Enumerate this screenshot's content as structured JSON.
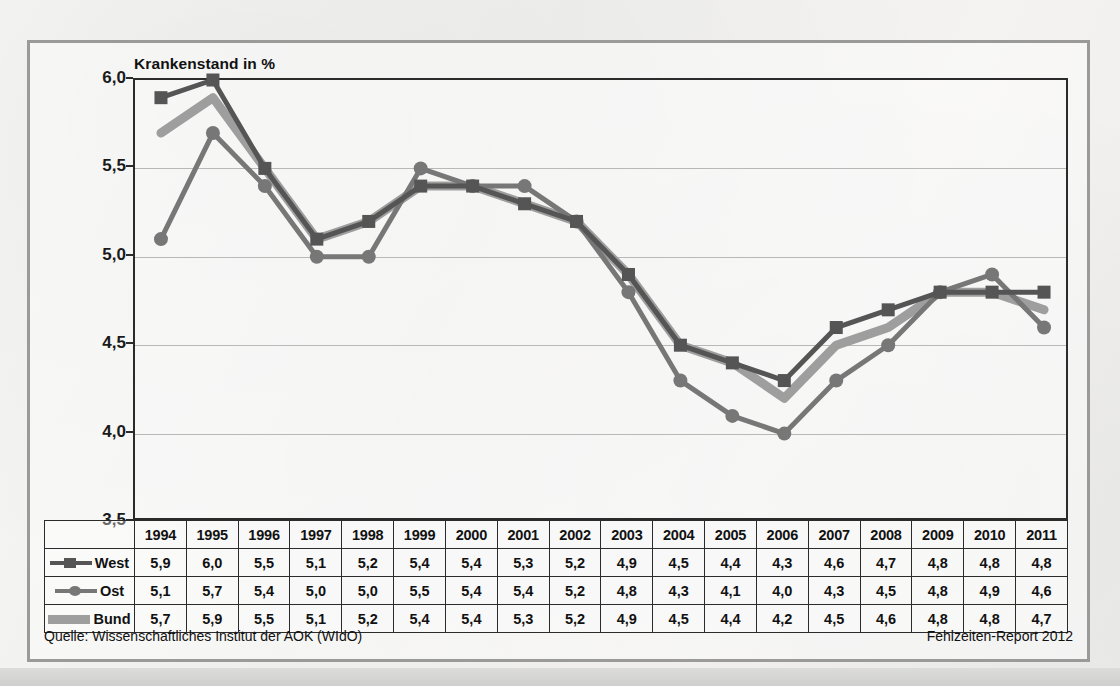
{
  "figure": {
    "source_label": "Quelle: Wissenschaftliches Institut der AOK (WIdO)",
    "report_label": "Fehlzeiten-Report 2012"
  },
  "colors": {
    "west": "#555555",
    "ost": "#777777",
    "bund": "#9e9e9e",
    "axis": "#2b2b2b",
    "grid": "#b8b8b6",
    "frame": "#9a9a98"
  },
  "table": {
    "corner_label": "",
    "row_labels": [
      "West",
      "Ost",
      "Bund"
    ]
  },
  "chart_data": {
    "type": "line",
    "title": "Krankenstand in %",
    "xlabel": "",
    "ylabel": "Krankenstand in %",
    "ylim": [
      3.5,
      6.0
    ],
    "yticks": [
      "3,5",
      "4,0",
      "4,5",
      "5,0",
      "5,5",
      "6,0"
    ],
    "ytick_values": [
      3.5,
      4.0,
      4.5,
      5.0,
      5.5,
      6.0
    ],
    "grid": true,
    "legend": "table-left",
    "categories": [
      "1994",
      "1995",
      "1996",
      "1997",
      "1998",
      "1999",
      "2000",
      "2001",
      "2002",
      "2003",
      "2004",
      "2005",
      "2006",
      "2007",
      "2008",
      "2009",
      "2010",
      "2011"
    ],
    "series": [
      {
        "name": "West",
        "marker": "square",
        "color": "#555555",
        "values": [
          5.9,
          6.0,
          5.5,
          5.1,
          5.2,
          5.4,
          5.4,
          5.3,
          5.2,
          4.9,
          4.5,
          4.4,
          4.3,
          4.6,
          4.7,
          4.8,
          4.8,
          4.8
        ],
        "labels": [
          "5,9",
          "6,0",
          "5,5",
          "5,1",
          "5,2",
          "5,4",
          "5,4",
          "5,3",
          "5,2",
          "4,9",
          "4,5",
          "4,4",
          "4,3",
          "4,6",
          "4,7",
          "4,8",
          "4,8",
          "4,8"
        ]
      },
      {
        "name": "Ost",
        "marker": "circle",
        "color": "#777777",
        "values": [
          5.1,
          5.7,
          5.4,
          5.0,
          5.0,
          5.5,
          5.4,
          5.4,
          5.2,
          4.8,
          4.3,
          4.1,
          4.0,
          4.3,
          4.5,
          4.8,
          4.9,
          4.6
        ],
        "labels": [
          "5,1",
          "5,7",
          "5,4",
          "5,0",
          "5,0",
          "5,5",
          "5,4",
          "5,4",
          "5,2",
          "4,8",
          "4,3",
          "4,1",
          "4,0",
          "4,3",
          "4,5",
          "4,8",
          "4,9",
          "4,6"
        ]
      },
      {
        "name": "Bund",
        "marker": "none",
        "color": "#9e9e9e",
        "values": [
          5.7,
          5.9,
          5.5,
          5.1,
          5.2,
          5.4,
          5.4,
          5.3,
          5.2,
          4.9,
          4.5,
          4.4,
          4.2,
          4.5,
          4.6,
          4.8,
          4.8,
          4.7
        ],
        "labels": [
          "5,7",
          "5,9",
          "5,5",
          "5,1",
          "5,2",
          "5,4",
          "5,4",
          "5,3",
          "5,2",
          "4,9",
          "4,5",
          "4,4",
          "4,2",
          "4,5",
          "4,6",
          "4,8",
          "4,8",
          "4,7"
        ]
      }
    ]
  }
}
